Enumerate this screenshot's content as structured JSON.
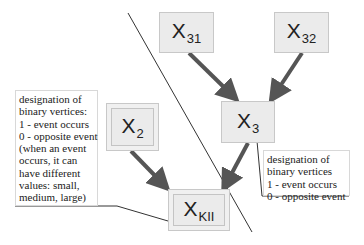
{
  "diagram": {
    "nodes": [
      {
        "id": "x31",
        "label": "X",
        "subscript": "31"
      },
      {
        "id": "x32",
        "label": "X",
        "subscript": "32"
      },
      {
        "id": "x3",
        "label": "X",
        "subscript": "3"
      },
      {
        "id": "x2",
        "label": "X",
        "subscript": "2"
      },
      {
        "id": "xkii",
        "label": "X",
        "subscript": "KII"
      }
    ],
    "edges": [
      {
        "from": "x31",
        "to": "x3"
      },
      {
        "from": "x32",
        "to": "x3"
      },
      {
        "from": "x3",
        "to": "xkii"
      },
      {
        "from": "x2",
        "to": "xkii"
      }
    ],
    "left_callout": {
      "lines": [
        "designation of",
        "binary vertices:",
        "1 - event occurs",
        "0 - opposite event",
        "(when an event",
        "occurs, it can",
        "have different",
        "values: small,",
        "medium, large)"
      ],
      "attached_to": "xkii"
    },
    "right_callout": {
      "lines": [
        "designation of",
        "binary vertices",
        "1 - event occurs",
        "0 - opposite event"
      ],
      "attached_to": "x3"
    },
    "colors": {
      "node_fill": "#ebebeb",
      "node_border": "#c8c8c8",
      "arrow": "#555555",
      "divider_line": "#333333"
    }
  }
}
